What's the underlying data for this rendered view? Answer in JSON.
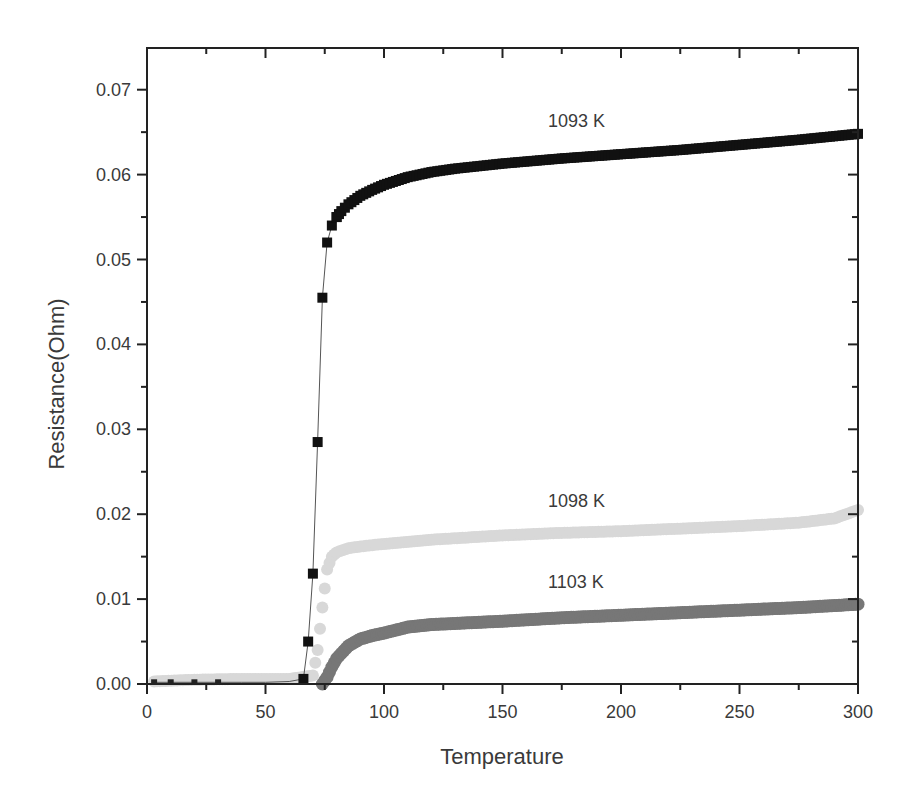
{
  "chart_data": {
    "type": "scatter",
    "title": "",
    "xlabel": "Temperature",
    "ylabel": "Resistance(Ohm)",
    "xlim": [
      0,
      300
    ],
    "ylim": [
      0,
      0.075
    ],
    "x_ticks": [
      "0",
      "50",
      "100",
      "150",
      "200",
      "250",
      "300"
    ],
    "y_ticks": [
      "0.00",
      "0.01",
      "0.02",
      "0.03",
      "0.04",
      "0.05",
      "0.06",
      "0.07"
    ],
    "grid": false,
    "legend": "none (inline curve annotations)",
    "annotations": [
      {
        "text": "1093 K",
        "x": 165,
        "y": 0.0665
      },
      {
        "text": "1098 K",
        "x": 165,
        "y": 0.0218
      },
      {
        "text": "1103 K",
        "x": 165,
        "y": 0.0122
      }
    ],
    "series": [
      {
        "name": "1093 K",
        "marker": "square",
        "color": "#111111",
        "x": [
          3,
          10,
          20,
          30,
          40,
          50,
          60,
          66,
          68,
          70,
          72,
          74,
          76,
          78,
          80,
          82,
          85,
          90,
          95,
          100,
          110,
          120,
          130,
          150,
          175,
          200,
          225,
          250,
          275,
          300
        ],
        "y": [
          0.0002,
          0.0002,
          0.0002,
          0.0002,
          0.0002,
          0.0002,
          0.0003,
          0.0006,
          0.005,
          0.013,
          0.0285,
          0.0455,
          0.052,
          0.054,
          0.055,
          0.0557,
          0.0565,
          0.0575,
          0.0582,
          0.0588,
          0.0597,
          0.0603,
          0.0607,
          0.0613,
          0.0619,
          0.0624,
          0.0629,
          0.0635,
          0.0641,
          0.0648
        ]
      },
      {
        "name": "1098 K",
        "marker": "triangle",
        "color": "#d8d8d8",
        "x": [
          3,
          20,
          40,
          60,
          70,
          72,
          74,
          76,
          78,
          80,
          85,
          90,
          100,
          120,
          150,
          175,
          200,
          225,
          250,
          275,
          290,
          300
        ],
        "y": [
          0.0003,
          0.0005,
          0.0006,
          0.0006,
          0.001,
          0.004,
          0.009,
          0.0135,
          0.015,
          0.0155,
          0.016,
          0.0162,
          0.0165,
          0.017,
          0.0175,
          0.0178,
          0.018,
          0.0183,
          0.0186,
          0.019,
          0.0195,
          0.0205
        ]
      },
      {
        "name": "1103 K",
        "marker": "circle",
        "color": "#777777",
        "x": [
          74,
          76,
          78,
          80,
          85,
          90,
          95,
          100,
          110,
          120,
          150,
          175,
          200,
          225,
          250,
          275,
          300
        ],
        "y": [
          0.0,
          0.0008,
          0.002,
          0.003,
          0.0045,
          0.0053,
          0.0057,
          0.006,
          0.0067,
          0.007,
          0.0074,
          0.0078,
          0.0081,
          0.0084,
          0.0087,
          0.009,
          0.0094
        ]
      }
    ]
  }
}
